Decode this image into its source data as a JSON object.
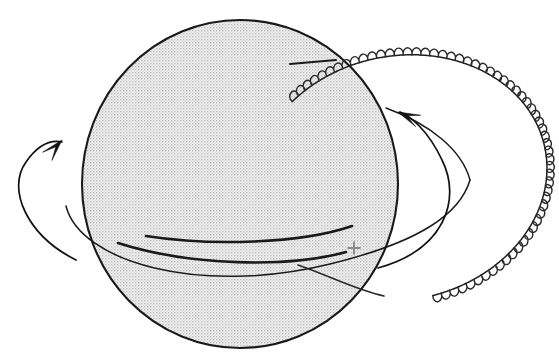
{
  "figure": {
    "type": "line-diagram",
    "width": 559,
    "height": 363,
    "background_color": "#ffffff"
  },
  "colors": {
    "outline": "#1a1a1a",
    "sphere_fill": "#e3e3e3",
    "halftone_dot": "#9a9a9a",
    "coil": "#2b2b2b",
    "arrow": "#111111",
    "center_marker": "#8a8a8a"
  },
  "sphere": {
    "label": "shaded sphere",
    "center_x": 240,
    "center_y": 184,
    "radius_x": 158,
    "radius_y": 164,
    "fill_style": "halftone-dither",
    "stroke_width": 2.1
  },
  "center_marker": {
    "label": "plus marker",
    "glyph": "+",
    "x": 354,
    "y": 248,
    "size": 13,
    "color": "#8a8a8a"
  },
  "bands": [
    {
      "name": "upper-band-arc",
      "description": "thick arc crossing sphere above equator",
      "path": "M 146 236 C 210 246 300 244 352 226"
    },
    {
      "name": "lower-band-arc",
      "description": "thick arc crossing sphere below equator",
      "path": "M 118 243 C 190 266 288 268 346 252"
    }
  ],
  "orbit": {
    "name": "thin-ellipse-orbit",
    "description": "thin elliptical orbit line passing behind and in front of sphere",
    "path": "M 66 206 C 80 262 200 296 330 264 C 420 242 460 214 470 180"
  },
  "coil": {
    "name": "coiled-ring",
    "description": "ring drawn as a repeating helical coil wrapping an elliptical arc on the right",
    "loop_count": 62,
    "loop_radius": 4.4,
    "start_point": {
      "x": 333,
      "y": 60
    },
    "end_point": {
      "x": 382,
      "y": 297
    },
    "rightmost_x": 548,
    "topmost_y": 57,
    "bottommost_y": 300
  },
  "leads": [
    {
      "name": "upper-straight-lead",
      "description": "short straight line from inside sphere to coil start",
      "path": "M 290 64 L 336 60"
    },
    {
      "name": "lower-curved-lead",
      "description": "thin curve from inside sphere out to lower coil end",
      "path": "M 298 265 C 330 276 356 290 384 296"
    }
  ],
  "arrows": [
    {
      "name": "left-rotation-arrow",
      "description": "curved arrow on the left pointing up and to the right",
      "curve_path": "M 76 260 C 28 236 6 190 26 162 C 40 142 52 140 62 142",
      "head_x": 62,
      "head_y": 140,
      "head_angle_deg": -48,
      "direction": "counterclockwise"
    },
    {
      "name": "right-rotation-arrow",
      "description": "curved arrow on the right pointing up and to the left",
      "curve_path": "M 378 268 C 444 250 462 200 442 160 C 428 130 410 116 400 112",
      "head_x": 398,
      "head_y": 112,
      "head_angle_deg": 204,
      "direction": "counterclockwise"
    }
  ]
}
